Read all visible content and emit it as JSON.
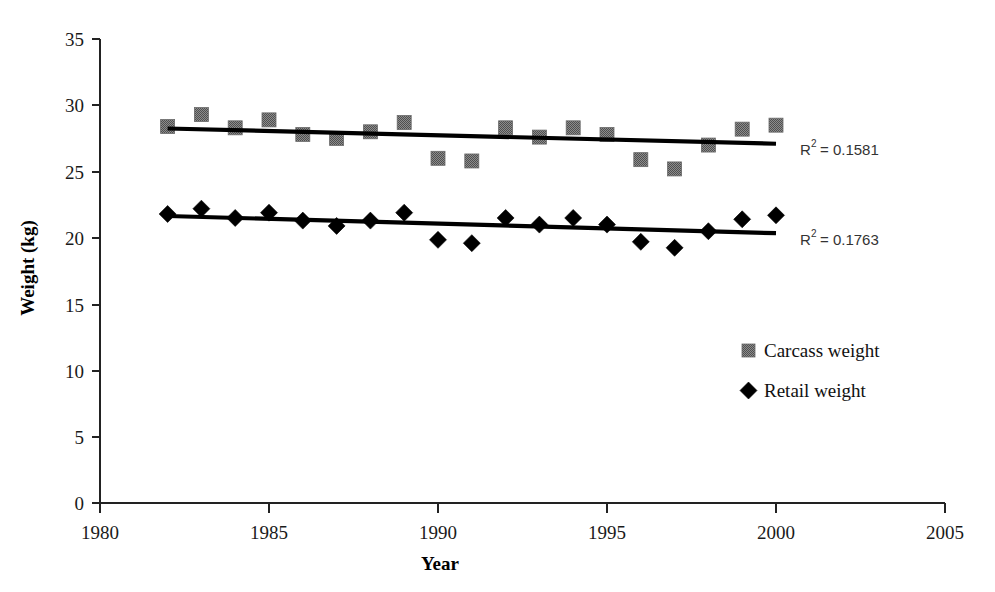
{
  "chart_data": {
    "type": "scatter",
    "title": "",
    "xlabel": "Year",
    "ylabel": "Weight (kg)",
    "xlim": [
      1980,
      2005
    ],
    "ylim": [
      0,
      35
    ],
    "xticks": [
      "1980",
      "1985",
      "1990",
      "1995",
      "2000",
      "2005"
    ],
    "yticks": [
      "0",
      "5",
      "10",
      "15",
      "20",
      "25",
      "30",
      "35"
    ],
    "grid": false,
    "legend_position": "right-middle",
    "x": [
      1982,
      1983,
      1984,
      1985,
      1986,
      1987,
      1988,
      1989,
      1990,
      1991,
      1992,
      1993,
      1994,
      1995,
      1996,
      1997,
      1998,
      1999,
      2000
    ],
    "series": [
      {
        "name": "Carcass weight",
        "marker": "square",
        "color": "#7a7a7a",
        "values": [
          28.4,
          29.3,
          28.3,
          28.9,
          27.8,
          27.5,
          28.0,
          28.7,
          26.0,
          25.8,
          28.3,
          27.6,
          28.3,
          27.8,
          25.9,
          25.2,
          27.0,
          28.2,
          28.5
        ],
        "trend": {
          "x_start": 1982,
          "y_start": 28.25,
          "x_end": 2000,
          "y_end": 27.1,
          "r2_label": "R",
          "r2_sup": "2",
          "r2_value": "= 0.1581"
        }
      },
      {
        "name": "Retail weight",
        "marker": "diamond",
        "color": "#000000",
        "values": [
          21.8,
          22.2,
          21.5,
          21.9,
          21.3,
          20.9,
          21.3,
          21.9,
          19.85,
          19.6,
          21.5,
          21.0,
          21.5,
          21.0,
          19.7,
          19.25,
          20.5,
          21.4,
          21.7
        ],
        "trend": {
          "x_start": 1982,
          "y_start": 21.65,
          "x_end": 2000,
          "y_end": 20.35,
          "r2_label": "R",
          "r2_sup": "2",
          "r2_value": "= 0.1763"
        }
      }
    ]
  },
  "axes": {
    "y_title": "Weight (kg)",
    "x_title": "Year",
    "y_tick_0": "0",
    "y_tick_5": "5",
    "y_tick_10": "10",
    "y_tick_15": "15",
    "y_tick_20": "20",
    "y_tick_25": "25",
    "y_tick_30": "30",
    "y_tick_35": "35",
    "x_tick_1980": "1980",
    "x_tick_1985": "1985",
    "x_tick_1990": "1990",
    "x_tick_1995": "1995",
    "x_tick_2000": "2000",
    "x_tick_2005": "2005"
  },
  "legend": {
    "item_1_label": "Carcass weight",
    "item_2_label": "Retail weight"
  },
  "annotations": {
    "carcass_r2_base": "R",
    "carcass_r2_exp": "2",
    "carcass_r2_rest": "= 0.1581",
    "retail_r2_base": "R",
    "retail_r2_exp": "2",
    "retail_r2_rest": "= 0.1763"
  }
}
